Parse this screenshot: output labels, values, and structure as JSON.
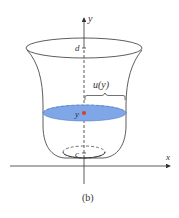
{
  "figure": {
    "caption": "(b)",
    "labels": {
      "y_axis": "y",
      "x_axis": "x",
      "top": "d",
      "bottom": "c",
      "level": "y",
      "radius": "u(y)"
    },
    "colors": {
      "liquid": "#7fa6e6",
      "liquid_edge": "#5a82cf",
      "point": "#e03a2a",
      "stroke": "#333333"
    }
  }
}
